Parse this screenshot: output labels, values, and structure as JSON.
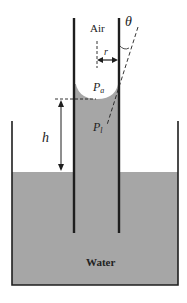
{
  "diagram": {
    "labels": {
      "air": "Air",
      "theta": "θ",
      "radius": "r",
      "pressure_air_main": "P",
      "pressure_air_sub": "a",
      "pressure_liquid_main": "P",
      "pressure_liquid_sub": "l",
      "height": "h",
      "water": "Water"
    },
    "colors": {
      "water": "#a6a6a6",
      "walls": "#1e1e1e",
      "background": "#ffffff",
      "text": "#222222"
    }
  }
}
